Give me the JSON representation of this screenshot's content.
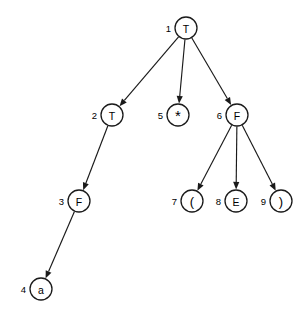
{
  "figure": {
    "kind": "parse-tree-diagram",
    "width": 308,
    "height": 310,
    "background_color": "#ffffff",
    "stroke_color": "#1a1a1a",
    "text_color": "#000000"
  },
  "chart_data": {
    "type": "diagram",
    "title": "",
    "subtitle": "",
    "xlabel": "",
    "ylabel": "",
    "grid": false,
    "legend": null,
    "node_radius": 11,
    "nodes": [
      {
        "id": 1,
        "index_label": "1",
        "symbol": "T",
        "symbol_class": "letter",
        "cx": 186,
        "cy": 28
      },
      {
        "id": 2,
        "index_label": "2",
        "symbol": "T",
        "symbol_class": "letter",
        "cx": 112,
        "cy": 115
      },
      {
        "id": 3,
        "index_label": "3",
        "symbol": "F",
        "symbol_class": "letter",
        "cx": 79,
        "cy": 201
      },
      {
        "id": 4,
        "index_label": "4",
        "symbol": "a",
        "symbol_class": "letter",
        "cx": 41,
        "cy": 289
      },
      {
        "id": 5,
        "index_label": "5",
        "symbol": "*",
        "symbol_class": "star",
        "cx": 178,
        "cy": 115
      },
      {
        "id": 6,
        "index_label": "6",
        "symbol": "F",
        "symbol_class": "letter",
        "cx": 237,
        "cy": 115
      },
      {
        "id": 7,
        "index_label": "7",
        "symbol": "(",
        "symbol_class": "paren",
        "cx": 192,
        "cy": 201
      },
      {
        "id": 8,
        "index_label": "8",
        "symbol": "E",
        "symbol_class": "letter",
        "cx": 236,
        "cy": 201
      },
      {
        "id": 9,
        "index_label": "9",
        "symbol": ")",
        "symbol_class": "paren",
        "cx": 281,
        "cy": 201
      }
    ],
    "edges": [
      {
        "from": 1,
        "to": 2,
        "directed": true
      },
      {
        "from": 1,
        "to": 5,
        "directed": true
      },
      {
        "from": 1,
        "to": 6,
        "directed": true
      },
      {
        "from": 2,
        "to": 3,
        "directed": true
      },
      {
        "from": 3,
        "to": 4,
        "directed": true
      },
      {
        "from": 6,
        "to": 7,
        "directed": true
      },
      {
        "from": 6,
        "to": 8,
        "directed": true
      },
      {
        "from": 6,
        "to": 9,
        "directed": true
      }
    ]
  }
}
